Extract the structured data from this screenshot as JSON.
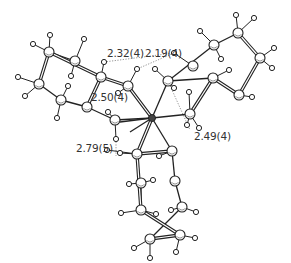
{
  "figure": {
    "type": "ball-and-stick molecular structure",
    "center_atom": "metal center",
    "colors": {
      "bond": "#222222",
      "atom_fill": "#ffffff",
      "atom_stroke": "#222222",
      "contact_line": "#777777",
      "label": "#333333"
    }
  },
  "distance_labels": [
    {
      "id": "d1",
      "text": "2.32(4)",
      "x": 107,
      "y": 54
    },
    {
      "id": "d2",
      "text": "2.19(4)",
      "x": 145,
      "y": 54
    },
    {
      "id": "d3",
      "text": "2.50(4)",
      "x": 92,
      "y": 96
    },
    {
      "id": "d4",
      "text": "2.79(5)",
      "x": 76,
      "y": 146
    },
    {
      "id": "d5",
      "text": "2.49(4)",
      "x": 194,
      "y": 134
    }
  ],
  "atoms": {
    "center": [
      152,
      118
    ],
    "carbons": [
      [
        49,
        52
      ],
      [
        75,
        61
      ],
      [
        39,
        84
      ],
      [
        61,
        100
      ],
      [
        101,
        77
      ],
      [
        87,
        107
      ],
      [
        128,
        86
      ],
      [
        115,
        120
      ],
      [
        238,
        33
      ],
      [
        260,
        58
      ],
      [
        214,
        45
      ],
      [
        193,
        66
      ],
      [
        239,
        95
      ],
      [
        213,
        78
      ],
      [
        168,
        81
      ],
      [
        190,
        114
      ],
      [
        137,
        154
      ],
      [
        172,
        151
      ],
      [
        141,
        183
      ],
      [
        175,
        181
      ],
      [
        141,
        210
      ],
      [
        182,
        207
      ],
      [
        150,
        239
      ],
      [
        180,
        235
      ]
    ],
    "hydrogens": [
      [
        50,
        35
      ],
      [
        33,
        44
      ],
      [
        84,
        39
      ],
      [
        71,
        76
      ],
      [
        18,
        77
      ],
      [
        25,
        96
      ],
      [
        68,
        86
      ],
      [
        57,
        118
      ],
      [
        104,
        62
      ],
      [
        137,
        69
      ],
      [
        118,
        93
      ],
      [
        116,
        139
      ],
      [
        108,
        112
      ],
      [
        107,
        150
      ],
      [
        236,
        15
      ],
      [
        254,
        18
      ],
      [
        274,
        48
      ],
      [
        272,
        68
      ],
      [
        200,
        31
      ],
      [
        221,
        59
      ],
      [
        174,
        53
      ],
      [
        155,
        69
      ],
      [
        174,
        88
      ],
      [
        189,
        92
      ],
      [
        229,
        70
      ],
      [
        252,
        97
      ],
      [
        187,
        125
      ],
      [
        199,
        128
      ],
      [
        120,
        153
      ],
      [
        159,
        156
      ],
      [
        153,
        180
      ],
      [
        129,
        184
      ],
      [
        121,
        213
      ],
      [
        171,
        210
      ],
      [
        156,
        214
      ],
      [
        196,
        212
      ],
      [
        134,
        248
      ],
      [
        150,
        258
      ],
      [
        176,
        252
      ],
      [
        195,
        238
      ]
    ]
  },
  "bonds_double": [
    [
      [
        49,
        52
      ],
      [
        101,
        77
      ]
    ],
    [
      [
        49,
        52
      ],
      [
        39,
        84
      ]
    ],
    [
      [
        101,
        77
      ],
      [
        128,
        86
      ]
    ],
    [
      [
        101,
        77
      ],
      [
        87,
        107
      ]
    ],
    [
      [
        128,
        86
      ],
      [
        152,
        118
      ]
    ],
    [
      [
        238,
        33
      ],
      [
        260,
        58
      ]
    ],
    [
      [
        260,
        58
      ],
      [
        239,
        95
      ]
    ],
    [
      [
        239,
        95
      ],
      [
        213,
        78
      ]
    ],
    [
      [
        213,
        78
      ],
      [
        190,
        114
      ]
    ],
    [
      [
        137,
        154
      ],
      [
        172,
        151
      ]
    ],
    [
      [
        137,
        154
      ],
      [
        141,
        210
      ]
    ],
    [
      [
        141,
        210
      ],
      [
        180,
        235
      ]
    ],
    [
      [
        150,
        239
      ],
      [
        180,
        235
      ]
    ],
    [
      [
        152,
        118
      ],
      [
        137,
        154
      ]
    ]
  ],
  "bonds_single": [
    [
      [
        39,
        84
      ],
      [
        61,
        100
      ]
    ],
    [
      [
        61,
        100
      ],
      [
        87,
        107
      ]
    ],
    [
      [
        87,
        107
      ],
      [
        115,
        120
      ]
    ],
    [
      [
        115,
        120
      ],
      [
        152,
        118
      ]
    ],
    [
      [
        49,
        52
      ],
      [
        75,
        61
      ]
    ],
    [
      [
        238,
        33
      ],
      [
        214,
        45
      ]
    ],
    [
      [
        214,
        45
      ],
      [
        168,
        81
      ]
    ],
    [
      [
        168,
        81
      ],
      [
        213,
        78
      ]
    ],
    [
      [
        168,
        81
      ],
      [
        152,
        118
      ]
    ],
    [
      [
        190,
        114
      ],
      [
        152,
        118
      ]
    ],
    [
      [
        172,
        151
      ],
      [
        152,
        118
      ]
    ],
    [
      [
        172,
        151
      ],
      [
        175,
        181
      ]
    ],
    [
      [
        175,
        181
      ],
      [
        182,
        207
      ]
    ],
    [
      [
        182,
        207
      ],
      [
        150,
        239
      ]
    ],
    [
      [
        141,
        183
      ],
      [
        141,
        210
      ]
    ],
    [
      [
        152,
        118
      ],
      [
        130,
        132
      ]
    ],
    [
      [
        152,
        118
      ],
      [
        120,
        122
      ]
    ]
  ],
  "contacts": [
    [
      [
        116,
        139
      ],
      [
        116,
        156
      ]
    ],
    [
      [
        168,
        81
      ],
      [
        190,
        130
      ]
    ],
    [
      [
        104,
        62
      ],
      [
        174,
        53
      ]
    ],
    [
      [
        174,
        53
      ],
      [
        137,
        69
      ]
    ]
  ]
}
